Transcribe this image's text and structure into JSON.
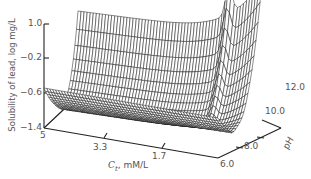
{
  "chart_data": {
    "type": "surface3d",
    "title": "",
    "zlabel": "Solubility of lead, log mg/L",
    "xlabel_var": "C",
    "xlabel_sub": "t",
    "xlabel_unit": ", mM/L",
    "ylabel": "pH",
    "z_ticks": [
      "1.0",
      "-0.2",
      "-0.6",
      "-1.4"
    ],
    "z_range": [
      -1.4,
      1.0
    ],
    "x_ticks": [
      "5",
      "3.3",
      "1.7"
    ],
    "x_range": [
      5,
      0
    ],
    "y_ticks": [
      "6.0",
      "8.0",
      "10.0",
      "12.0"
    ],
    "y_range": [
      6.0,
      12.0
    ],
    "grid": false
  },
  "axes": {
    "z_tick_labels": [
      "1.0",
      "−0.2",
      "−0.6",
      "−1.4"
    ],
    "x_tick_labels": [
      "5",
      "3.3",
      "1.7"
    ],
    "y_tick_labels": [
      "6.0",
      "8.0",
      "10.0",
      "12.0"
    ],
    "zlabel": "Solubility of lead, log mg/L",
    "xlabel_var": "C",
    "xlabel_sub": "t",
    "xlabel_unit": ", mM/L",
    "ylabel": "pH"
  }
}
